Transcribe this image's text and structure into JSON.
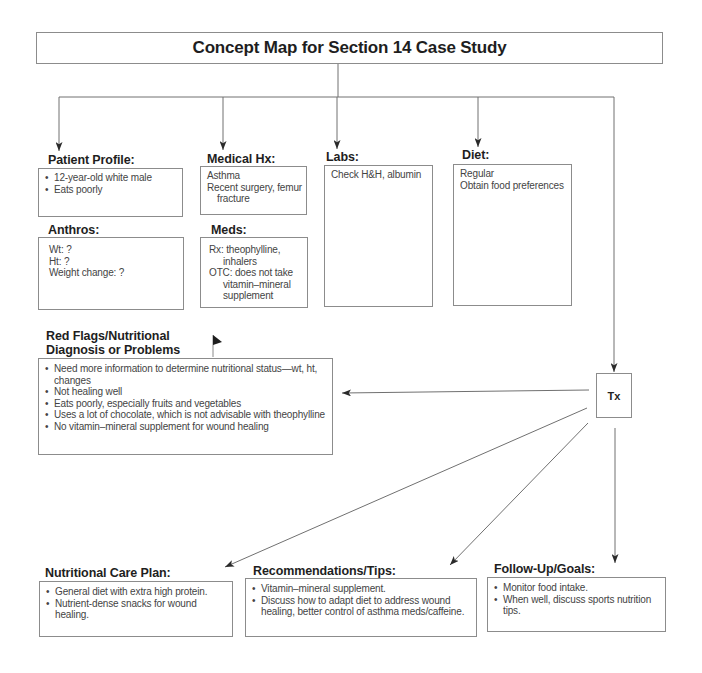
{
  "title": "Concept Map for Section 14 Case Study",
  "nodes": {
    "patient_profile": {
      "heading": "Patient Profile:",
      "items": [
        "12-year-old white male",
        "Eats poorly"
      ]
    },
    "medical_hx": {
      "heading": "Medical Hx:",
      "items": [
        "Asthma",
        "Recent surgery, femur fracture"
      ]
    },
    "labs": {
      "heading": "Labs:",
      "items": [
        "Check H&H, albumin"
      ]
    },
    "diet": {
      "heading": "Diet:",
      "items": [
        "Regular",
        "Obtain food preferences"
      ]
    },
    "anthros": {
      "heading": "Anthros:",
      "items": [
        "Wt: ?",
        "Ht: ?",
        "Weight change: ?"
      ]
    },
    "meds": {
      "heading": "Meds:",
      "items": [
        "Rx: theophylline, inhalers",
        "OTC: does not take vitamin–mineral supplement"
      ]
    },
    "red_flags": {
      "heading_line1": "Red Flags/Nutritional",
      "heading_line2": "Diagnosis or Problems",
      "items": [
        "Need more information to determine nutritional status—wt, ht, changes",
        "Not healing well",
        "Eats poorly, especially fruits and vegetables",
        "Uses a lot of chocolate, which is not advisable with theophylline",
        "No vitamin–mineral supplement for wound healing"
      ]
    },
    "tx": {
      "label": "Tx"
    },
    "care_plan": {
      "heading": "Nutritional Care Plan:",
      "items": [
        "General diet with extra high protein.",
        "Nutrient-dense snacks for wound healing."
      ]
    },
    "recommendations": {
      "heading": "Recommendations/Tips:",
      "items": [
        "Vitamin–mineral supplement.",
        "Discuss how to adapt diet to address wound healing, better control of asthma meds/caffeine."
      ]
    },
    "follow_up": {
      "heading": "Follow-Up/Goals:",
      "items": [
        "Monitor food intake.",
        "When well, discuss sports nutrition tips."
      ]
    }
  },
  "connections": [
    {
      "from": "title",
      "to": "patient_profile"
    },
    {
      "from": "title",
      "to": "medical_hx"
    },
    {
      "from": "title",
      "to": "labs"
    },
    {
      "from": "title",
      "to": "diet"
    },
    {
      "from": "title",
      "to": "tx"
    },
    {
      "from": "tx",
      "to": "red_flags"
    },
    {
      "from": "tx",
      "to": "care_plan"
    },
    {
      "from": "tx",
      "to": "recommendations"
    },
    {
      "from": "tx",
      "to": "follow_up"
    }
  ],
  "icons": {
    "flag": "flag-icon"
  }
}
